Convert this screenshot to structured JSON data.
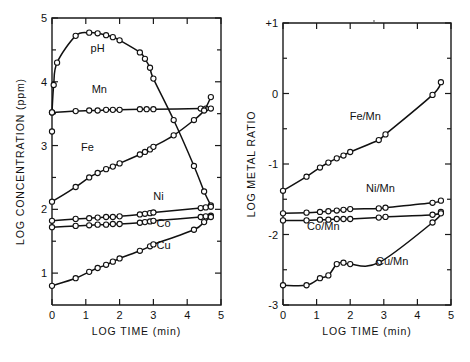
{
  "figure": {
    "background": "#ffffff",
    "ink": "#111111"
  },
  "chart_data": [
    {
      "id": "left",
      "type": "line",
      "title": "",
      "xlabel": "LOG TIME (min)",
      "ylabel": "LOG CONCENTRATION (ppm)",
      "xlim": [
        0,
        5
      ],
      "ylim": [
        0.5,
        5
      ],
      "xticks": [
        0,
        1,
        2,
        3,
        4,
        5
      ],
      "xticklabels": [
        "0",
        "1",
        "2",
        "3",
        "4",
        "5"
      ],
      "yticks": [
        1,
        2,
        3,
        4,
        5
      ],
      "yticklabels": [
        "1",
        "2",
        "3",
        "4",
        "5"
      ],
      "yminorticks": [
        1.5,
        2.5,
        3.5,
        4.5
      ],
      "grid": false,
      "legend": "inline-labels",
      "markers": "open-circle",
      "series": [
        {
          "name": "pH",
          "label": "pH",
          "label_x": 1.35,
          "label_y": 4.46,
          "x": [
            0.0,
            0.05,
            0.15,
            0.7,
            1.1,
            1.35,
            1.6,
            1.8,
            2.0,
            2.6,
            2.75,
            2.9,
            3.0,
            3.6,
            4.2,
            4.5,
            4.7
          ],
          "y": [
            3.52,
            3.95,
            4.3,
            4.72,
            4.77,
            4.76,
            4.73,
            4.7,
            4.65,
            4.46,
            4.36,
            4.22,
            4.05,
            3.4,
            2.68,
            2.28,
            2.06
          ]
        },
        {
          "name": "Mn",
          "label": "Mn",
          "label_x": 1.4,
          "label_y": 3.82,
          "x": [
            0.0,
            0.7,
            1.1,
            1.35,
            1.6,
            1.8,
            2.0,
            2.6,
            2.8,
            3.0,
            4.4,
            4.55,
            4.7
          ],
          "y": [
            3.52,
            3.54,
            3.55,
            3.55,
            3.56,
            3.56,
            3.56,
            3.57,
            3.57,
            3.57,
            3.58,
            3.58,
            3.58
          ]
        },
        {
          "name": "Fe",
          "label": "Fe",
          "label_x": 1.05,
          "label_y": 2.92,
          "x": [
            0.0,
            0.7,
            1.1,
            1.35,
            1.6,
            1.8,
            2.0,
            2.6,
            2.75,
            2.9,
            3.0,
            3.6,
            4.2,
            4.5,
            4.7
          ],
          "y": [
            2.12,
            2.35,
            2.5,
            2.57,
            2.63,
            2.67,
            2.72,
            2.86,
            2.9,
            2.94,
            2.98,
            3.16,
            3.4,
            3.55,
            3.76
          ]
        },
        {
          "name": "Ni",
          "label": "Ni",
          "label_x": 3.15,
          "label_y": 2.14,
          "x": [
            0.0,
            0.7,
            1.1,
            1.35,
            1.6,
            1.8,
            2.0,
            2.6,
            2.75,
            2.9,
            3.0,
            4.4,
            4.55,
            4.7
          ],
          "y": [
            1.82,
            1.85,
            1.86,
            1.87,
            1.88,
            1.88,
            1.89,
            1.92,
            1.93,
            1.94,
            1.95,
            2.02,
            2.03,
            2.04
          ]
        },
        {
          "name": "Co",
          "label": "Co",
          "label_x": 3.3,
          "label_y": 1.72,
          "x": [
            0.0,
            0.7,
            1.1,
            1.35,
            1.6,
            1.8,
            2.0,
            2.6,
            2.75,
            2.9,
            3.0,
            4.4,
            4.55,
            4.7
          ],
          "y": [
            1.72,
            1.74,
            1.75,
            1.76,
            1.76,
            1.77,
            1.77,
            1.79,
            1.8,
            1.81,
            1.82,
            1.88,
            1.89,
            1.9
          ]
        },
        {
          "name": "Cu",
          "label": "Cu",
          "label_x": 3.3,
          "label_y": 1.38,
          "x": [
            0.0,
            0.7,
            1.1,
            1.35,
            1.6,
            1.8,
            2.0,
            2.6,
            2.9,
            3.0,
            4.2,
            4.5,
            4.7
          ],
          "y": [
            0.8,
            0.92,
            1.02,
            1.08,
            1.13,
            1.18,
            1.23,
            1.35,
            1.42,
            1.45,
            1.68,
            1.8,
            1.88
          ]
        }
      ],
      "stray_point": {
        "x": 0.0,
        "y": 3.22
      }
    },
    {
      "id": "right",
      "type": "line",
      "title": "",
      "xlabel": "LOG TIME (min)",
      "ylabel": "LOG METAL RATIO",
      "xlim": [
        0,
        5
      ],
      "ylim": [
        -3,
        1
      ],
      "xticks": [
        0,
        1,
        2,
        3,
        4,
        5
      ],
      "xticklabels": [
        "0",
        "1",
        "2",
        "3",
        "4",
        "5"
      ],
      "yticks": [
        1,
        0,
        -1,
        -2,
        -3
      ],
      "yticklabels": [
        "+1",
        "0",
        "-1",
        "-2",
        "-3"
      ],
      "yminorticks": [
        0.5,
        -0.5,
        -1.5,
        -2.5
      ],
      "grid": false,
      "legend": "inline-labels",
      "markers": "open-circle",
      "series": [
        {
          "name": "Fe/Mn",
          "label": "Fe/Mn",
          "label_x": 2.45,
          "label_y": -0.38,
          "x": [
            0.0,
            0.7,
            1.1,
            1.35,
            1.6,
            1.8,
            2.0,
            2.85,
            3.05,
            4.45,
            4.7
          ],
          "y": [
            -1.38,
            -1.18,
            -1.05,
            -0.98,
            -0.92,
            -0.88,
            -0.83,
            -0.66,
            -0.58,
            -0.02,
            0.16
          ]
        },
        {
          "name": "Ni/Mn",
          "label": "Ni/Mn",
          "label_x": 2.9,
          "label_y": -1.4,
          "x": [
            0.0,
            0.7,
            1.1,
            1.35,
            1.6,
            1.8,
            2.0,
            2.85,
            3.05,
            4.45,
            4.7
          ],
          "y": [
            -1.7,
            -1.69,
            -1.68,
            -1.67,
            -1.66,
            -1.65,
            -1.64,
            -1.63,
            -1.62,
            -1.55,
            -1.52
          ]
        },
        {
          "name": "Co/Mn",
          "label": "Co/Mn",
          "label_x": 1.2,
          "label_y": -1.93,
          "x": [
            0.0,
            0.7,
            1.1,
            1.35,
            1.6,
            1.8,
            2.0,
            2.85,
            3.05,
            4.45,
            4.7
          ],
          "y": [
            -1.8,
            -1.8,
            -1.79,
            -1.79,
            -1.78,
            -1.78,
            -1.78,
            -1.76,
            -1.75,
            -1.72,
            -1.68
          ]
        },
        {
          "name": "Cu/Mn",
          "label": "Cu/Mn",
          "label_x": 3.25,
          "label_y": -2.43,
          "x": [
            0.0,
            0.7,
            1.1,
            1.35,
            1.6,
            1.8,
            2.0,
            2.85,
            4.45,
            4.7
          ],
          "y": [
            -2.72,
            -2.72,
            -2.62,
            -2.58,
            -2.42,
            -2.4,
            -2.42,
            -2.4,
            -1.83,
            -1.7
          ]
        }
      ]
    }
  ]
}
